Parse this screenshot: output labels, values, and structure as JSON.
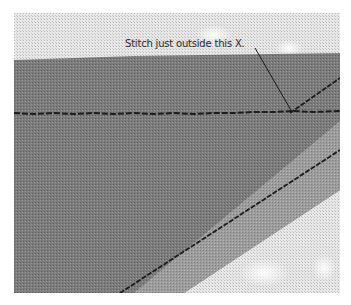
{
  "image": {
    "subject": "fabric-stitching-closeup",
    "callout": {
      "text": "Stitch just outside this X."
    },
    "colors": {
      "background_fabric": "#e4e4e4",
      "dark_fabric": "#7a7a7a",
      "diagonal_band": "#9a9a9a",
      "stitch_thread": "#1c1c1c",
      "label_text": "#2a2a2a"
    }
  }
}
